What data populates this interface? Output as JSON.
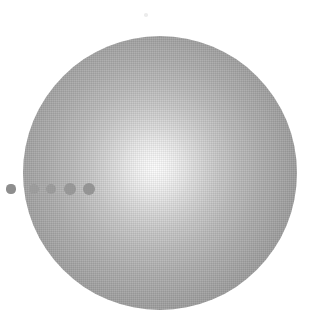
{
  "figure": {
    "caption": "",
    "canvas": {
      "width": 318,
      "height": 329,
      "background": "#ffffff"
    },
    "style": "grayscale halftone illustration"
  },
  "chart_data": {
    "type": "scatter",
    "subtitle": "",
    "xlabel": "",
    "ylabel": "",
    "xlim": [
      0,
      318
    ],
    "ylim": [
      0,
      329
    ],
    "grid": false,
    "legend": null,
    "annotations": [],
    "tick_labels": {
      "x": [],
      "y": []
    },
    "sphere": {
      "label": "illuminated sphere",
      "center_x": 160,
      "center_y": 173,
      "radius": 137,
      "highlight_x": 155,
      "highlight_y": 168,
      "center_color": "#fdfdfd",
      "mid_color": "#b0b0b0",
      "rim_color": "#8e8e8e"
    },
    "series": [
      {
        "name": "transit dots",
        "color": "#8a8a8a",
        "points": [
          {
            "index": 1,
            "x": 11,
            "y": 189,
            "radius": 4.6,
            "color": "#8e8e8e",
            "inside_sphere": false
          },
          {
            "index": 2,
            "x": 34,
            "y": 189,
            "radius": 5.0,
            "color": "#9c9c9c",
            "inside_sphere": true
          },
          {
            "index": 3,
            "x": 51,
            "y": 189,
            "radius": 5.4,
            "color": "#9a9a9a",
            "inside_sphere": true
          },
          {
            "index": 4,
            "x": 70,
            "y": 189,
            "radius": 5.8,
            "color": "#979797",
            "inside_sphere": true
          },
          {
            "index": 5,
            "x": 89,
            "y": 189,
            "radius": 6.1,
            "color": "#949494",
            "inside_sphere": true
          }
        ]
      },
      {
        "name": "specks",
        "color": "#e6e6e6",
        "points": [
          {
            "index": 1,
            "x": 146,
            "y": 15,
            "radius": 1.8,
            "color": "#ececec",
            "inside_sphere": false
          }
        ]
      }
    ]
  }
}
